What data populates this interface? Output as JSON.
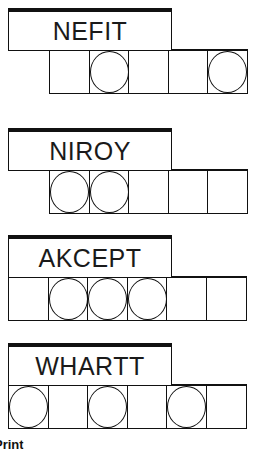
{
  "puzzles": [
    {
      "scrambled": "NEFIT",
      "top": 8,
      "cells_left": 49,
      "cells": [
        {
          "circled": false
        },
        {
          "circled": true
        },
        {
          "circled": false
        },
        {
          "circled": false
        },
        {
          "circled": true
        }
      ]
    },
    {
      "scrambled": "NIROY",
      "top": 128,
      "cells_left": 49,
      "cells": [
        {
          "circled": true
        },
        {
          "circled": true
        },
        {
          "circled": false
        },
        {
          "circled": false
        },
        {
          "circled": false
        }
      ]
    },
    {
      "scrambled": "AKCEPT",
      "top": 235,
      "cells_left": 8,
      "cells": [
        {
          "circled": false
        },
        {
          "circled": true
        },
        {
          "circled": true
        },
        {
          "circled": true
        },
        {
          "circled": false
        },
        {
          "circled": false
        }
      ]
    },
    {
      "scrambled": "WHARTT",
      "top": 343,
      "cells_left": 8,
      "cells": [
        {
          "circled": true
        },
        {
          "circled": false
        },
        {
          "circled": true
        },
        {
          "circled": false
        },
        {
          "circled": true
        },
        {
          "circled": false
        }
      ]
    }
  ],
  "footer": {
    "text": "Print"
  },
  "colors": {
    "ink": "#111111",
    "background": "#ffffff"
  }
}
